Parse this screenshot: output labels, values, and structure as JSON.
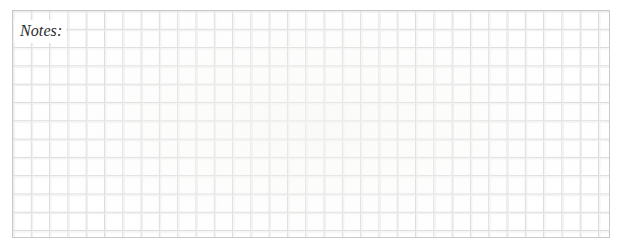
{
  "page": {
    "width": 617,
    "height": 250,
    "background_color": "#ffffff"
  },
  "notes_box": {
    "label": "Notes:",
    "label_style": "italic-serif",
    "label_color": "#2b2b2b",
    "content": "",
    "border_color": "#c9c9c9",
    "fill_color": "#ffffff",
    "x": 12,
    "y": 10,
    "width": 598,
    "height": 228,
    "grid": {
      "type": "square-graph-paper",
      "cell_size_px": 18.3,
      "line_color": "#dadada",
      "faint_line_color": "#ececec",
      "columns": 33,
      "rows": 12
    }
  }
}
